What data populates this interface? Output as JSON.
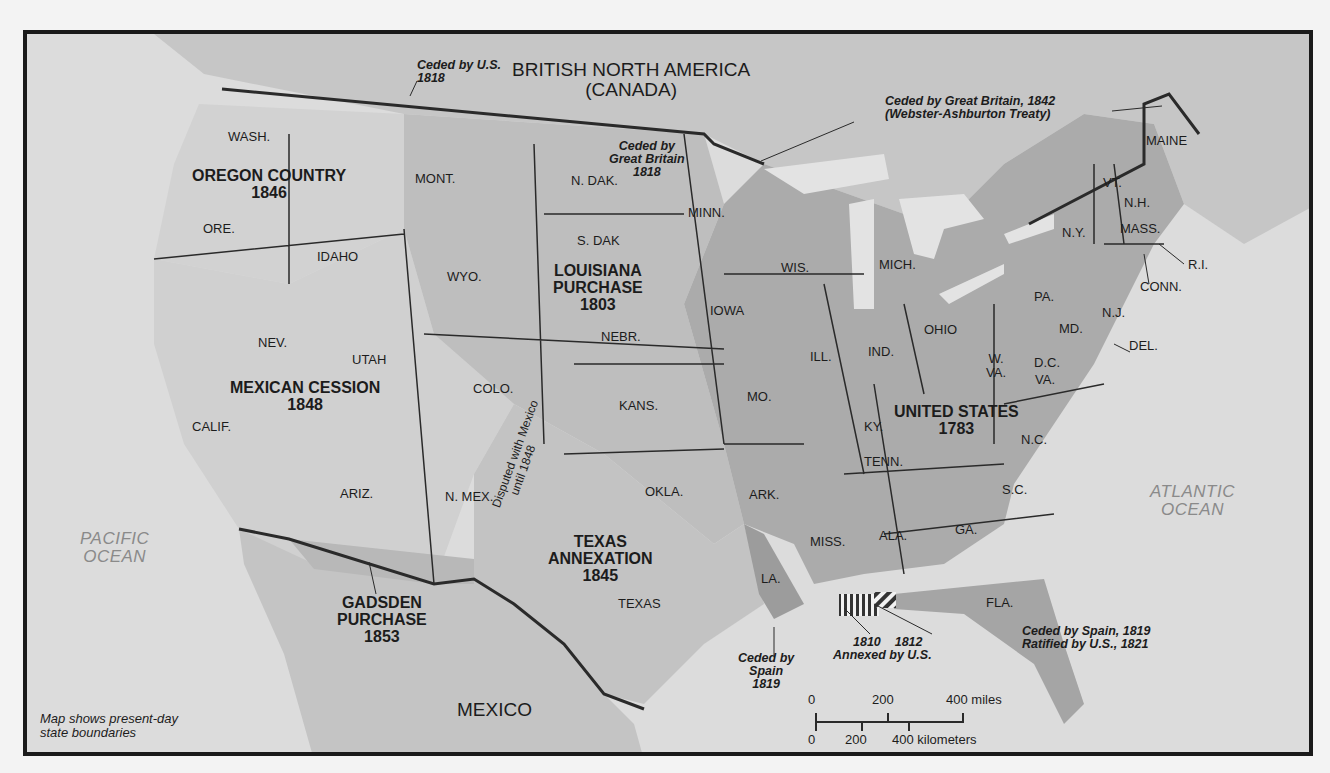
{
  "map": {
    "country_labels": {
      "british_north_america": "BRITISH NORTH AMERICA",
      "canada": "(CANADA)",
      "mexico": "MEXICO"
    },
    "oceans": {
      "pacific": [
        "PACIFIC",
        "OCEAN"
      ],
      "atlantic": [
        "ATLANTIC",
        "OCEAN"
      ]
    },
    "regions": [
      {
        "id": "oregon",
        "name": "OREGON COUNTRY",
        "year": "1846"
      },
      {
        "id": "louisiana",
        "name": "LOUISIANA",
        "name2": "PURCHASE",
        "year": "1803"
      },
      {
        "id": "mexican_cession",
        "name": "MEXICAN CESSION",
        "year": "1848"
      },
      {
        "id": "united_states",
        "name": "UNITED STATES",
        "year": "1783"
      },
      {
        "id": "texas",
        "name": "TEXAS",
        "name2": "ANNEXATION",
        "year": "1845"
      },
      {
        "id": "gadsden",
        "name": "GADSDEN",
        "name2": "PURCHASE",
        "year": "1853"
      }
    ],
    "annotations": {
      "ceded_by_us": [
        "Ceded by U.S.",
        "1818"
      ],
      "ceded_by_gb_1818": [
        "Ceded by",
        "Great Britain",
        "1818"
      ],
      "ceded_by_gb_1842": [
        "Ceded by Great Britain, 1842",
        "(Webster-Ashburton Treaty)"
      ],
      "disputed": [
        "Disputed with Mexico",
        "until 1848"
      ],
      "ceded_by_spain_1819": [
        "Ceded by",
        "Spain",
        "1819"
      ],
      "annexed": [
        "1810",
        "1812",
        "Annexed by U.S."
      ],
      "florida": [
        "Ceded by Spain, 1819",
        "Ratified by U.S., 1821"
      ]
    },
    "states": {
      "wash": "WASH.",
      "ore": "ORE.",
      "idaho": "IDAHO",
      "mont": "MONT.",
      "wyo": "WYO.",
      "nev": "NEV.",
      "utah": "UTAH",
      "calif": "CALIF.",
      "ariz": "ARIZ.",
      "colo": "COLO.",
      "nmex": "N. MEX.",
      "ndak": "N. DAK.",
      "sdak": "S. DAK",
      "nebr": "NEBR.",
      "kans": "KANS.",
      "okla": "OKLA.",
      "texas": "TEXAS",
      "minn": "MINN.",
      "iowa": "IOWA",
      "mo": "MO.",
      "ark": "ARK.",
      "la": "LA.",
      "wis": "WIS.",
      "ill": "ILL.",
      "mich": "MICH.",
      "ind": "IND.",
      "ohio": "OHIO",
      "ky": "KY.",
      "tenn": "TENN.",
      "miss": "MISS.",
      "ala": "ALA.",
      "ga": "GA.",
      "fla": "FLA.",
      "sc": "S.C.",
      "nc": "N.C.",
      "va": "VA.",
      "wva1": "W.",
      "wva2": "VA.",
      "dc": "D.C.",
      "md": "MD.",
      "del": "DEL.",
      "nj": "N.J.",
      "pa": "PA.",
      "ny": "N.Y.",
      "conn": "CONN.",
      "ri": "R.I.",
      "mass": "MASS.",
      "vt": "VT.",
      "nh": "N.H.",
      "maine": "MAINE"
    },
    "scale": {
      "miles_ticks": [
        "0",
        "200",
        "400 miles"
      ],
      "km_ticks": [
        "0",
        "200",
        "400 kilometers"
      ]
    },
    "caption": [
      "Map shows present-day",
      "state boundaries"
    ],
    "colors": {
      "ocean": "#dcdcdc",
      "foreign_land": "#c4c4c4",
      "us_1783": "#a9a9a9",
      "louisiana": "#bdbdbd",
      "western": "#cfcfcf",
      "texas": "#c2c2c2",
      "spain_ceded": "#9a9a9a",
      "border": "#2a2a2a"
    }
  }
}
